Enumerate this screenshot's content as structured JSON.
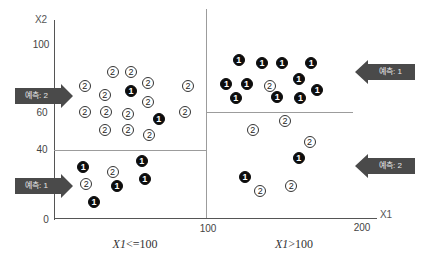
{
  "chart_data": {
    "type": "scatter",
    "title": "",
    "xlabel": "X1",
    "ylabel": "X2",
    "xlim": [
      0,
      200
    ],
    "ylim": [
      0,
      100
    ],
    "x_ticks": [
      "100",
      "200"
    ],
    "y_ticks": [
      "0",
      "40",
      "60",
      "100"
    ],
    "grid": false,
    "splits": [
      {
        "axis": "x",
        "value": 100,
        "label": "X1<=100 | X1>100"
      },
      {
        "axis": "y",
        "value": 40,
        "range_x": [
          0,
          100
        ]
      },
      {
        "axis": "y",
        "value": 60,
        "range_x": [
          100,
          195
        ]
      }
    ],
    "region_labels": [
      {
        "text": "X1<=100",
        "x_var": "X1",
        "rest": "<=100"
      },
      {
        "text": "X1>100",
        "x_var": "X1",
        "rest": ">100"
      }
    ],
    "predictions": [
      {
        "region": "X1<=100, X2>40",
        "label": "예측: 2"
      },
      {
        "region": "X1<=100, X2<=40",
        "label": "예측: 1"
      },
      {
        "region": "X1>100, X2>60",
        "label": "예측: 1"
      },
      {
        "region": "X1>100, X2<=60",
        "label": "예측: 2"
      }
    ],
    "legend": [
      {
        "class": "1",
        "style": "filled black circle"
      },
      {
        "class": "2",
        "style": "outlined white circle"
      }
    ],
    "points": [
      {
        "x": 38,
        "y": 84,
        "class": "2"
      },
      {
        "x": 50,
        "y": 84,
        "class": "2"
      },
      {
        "x": 20,
        "y": 76,
        "class": "2"
      },
      {
        "x": 61,
        "y": 78,
        "class": "2"
      },
      {
        "x": 50,
        "y": 73,
        "class": "1"
      },
      {
        "x": 87,
        "y": 76,
        "class": "2"
      },
      {
        "x": 33,
        "y": 71,
        "class": "2"
      },
      {
        "x": 61,
        "y": 67,
        "class": "2"
      },
      {
        "x": 20,
        "y": 61,
        "class": "2"
      },
      {
        "x": 34,
        "y": 61,
        "class": "2"
      },
      {
        "x": 48,
        "y": 60,
        "class": "2"
      },
      {
        "x": 85,
        "y": 61,
        "class": "2"
      },
      {
        "x": 68,
        "y": 57,
        "class": "1"
      },
      {
        "x": 33,
        "y": 51,
        "class": "2"
      },
      {
        "x": 48,
        "y": 51,
        "class": "2"
      },
      {
        "x": 62,
        "y": 48,
        "class": "2"
      },
      {
        "x": 19,
        "y": 30,
        "class": "1"
      },
      {
        "x": 38,
        "y": 27,
        "class": "2"
      },
      {
        "x": 57,
        "y": 33,
        "class": "1"
      },
      {
        "x": 21,
        "y": 20,
        "class": "2"
      },
      {
        "x": 41,
        "y": 19,
        "class": "1"
      },
      {
        "x": 59,
        "y": 23,
        "class": "1"
      },
      {
        "x": 26,
        "y": 10,
        "class": "1"
      },
      {
        "x": 120,
        "y": 91,
        "class": "1"
      },
      {
        "x": 135,
        "y": 89,
        "class": "1"
      },
      {
        "x": 148,
        "y": 89,
        "class": "1"
      },
      {
        "x": 167,
        "y": 89,
        "class": "1"
      },
      {
        "x": 112,
        "y": 77,
        "class": "1"
      },
      {
        "x": 125,
        "y": 77,
        "class": "1"
      },
      {
        "x": 140,
        "y": 76,
        "class": "2"
      },
      {
        "x": 159,
        "y": 80,
        "class": "1"
      },
      {
        "x": 171,
        "y": 74,
        "class": "1"
      },
      {
        "x": 118,
        "y": 69,
        "class": "1"
      },
      {
        "x": 145,
        "y": 70,
        "class": "1"
      },
      {
        "x": 160,
        "y": 69,
        "class": "1"
      },
      {
        "x": 150,
        "y": 56,
        "class": "2"
      },
      {
        "x": 129,
        "y": 51,
        "class": "2"
      },
      {
        "x": 166,
        "y": 44,
        "class": "2"
      },
      {
        "x": 159,
        "y": 35,
        "class": "1"
      },
      {
        "x": 124,
        "y": 24,
        "class": "1"
      },
      {
        "x": 134,
        "y": 16,
        "class": "2"
      },
      {
        "x": 154,
        "y": 19,
        "class": "2"
      }
    ]
  },
  "axes": {
    "x_title": "X1",
    "y_title": "X2",
    "x_ticks": [
      {
        "label": "100",
        "value": 100
      },
      {
        "label": "200",
        "value": 200
      }
    ],
    "y_ticks": [
      {
        "label": "100",
        "value": 100
      },
      {
        "label": "60",
        "value": 60
      },
      {
        "label": "40",
        "value": 40
      },
      {
        "label": "0",
        "value": 0
      }
    ]
  },
  "regions": {
    "left": {
      "var": "X1",
      "op": "<=100"
    },
    "right": {
      "var": "X1",
      "op": ">100"
    }
  },
  "arrows": [
    {
      "label": "예측: 2",
      "direction": "right",
      "left": 15,
      "top": 84
    },
    {
      "label": "예측: 1",
      "direction": "right",
      "left": 15,
      "top": 174
    },
    {
      "label": "예측: 1",
      "direction": "left",
      "left": 355,
      "top": 60
    },
    {
      "label": "예측: 2",
      "direction": "left",
      "left": 355,
      "top": 154
    }
  ],
  "colors": {
    "class1_fill": "#0d0d0d",
    "class2_fill": "#ffffff",
    "arrow_fill": "#4a4a4a",
    "split_line": "#9c9c9c",
    "axis_line": "#555555"
  }
}
